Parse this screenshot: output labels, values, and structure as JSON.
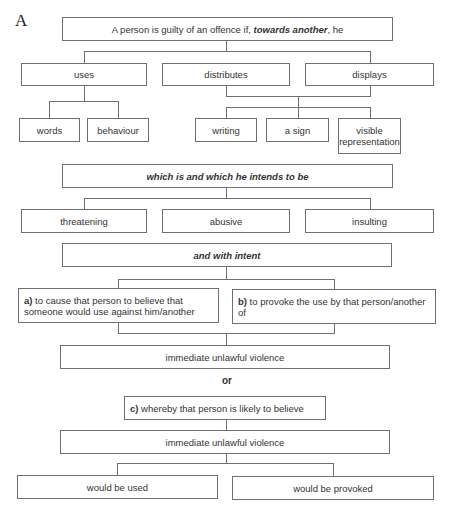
{
  "figure_label": "A",
  "root": {
    "text_before": "A person is guilty of an offence if, ",
    "text_emph": "towards another",
    "text_after": ", he"
  },
  "actions": [
    "uses",
    "distributes",
    "displays"
  ],
  "uses_children": [
    "words",
    "behaviour"
  ],
  "display_children": [
    "writing",
    "a sign",
    "visible representation"
  ],
  "which_box": "which is and which he intends to be",
  "qualities": [
    "threatening",
    "abusive",
    "insulting"
  ],
  "intent_box": "and with intent",
  "intent_options": {
    "a": {
      "marker": "a)",
      "text": " to cause that person to believe that someone would use against him/another"
    },
    "b": {
      "marker": "b)",
      "text": " to provoke the use by that person/another of"
    }
  },
  "violence_box_1": "immediate unlawful violence",
  "or_label": "or",
  "option_c": {
    "marker": "c)",
    "text": " whereby that person is likely to believe"
  },
  "violence_box_2": "immediate unlawful violence",
  "outcomes": [
    "would be used",
    "would be provoked"
  ]
}
